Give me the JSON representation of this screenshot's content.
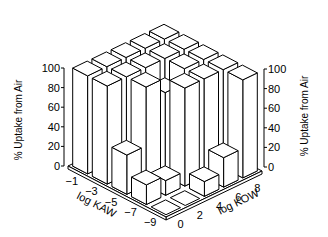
{
  "chart_data": {
    "type": "bar3d",
    "title": "",
    "zlabel": "% Uptake from Air",
    "xlabel": "log KAW",
    "ylabel": "log KOW",
    "kaw_ticks": [
      "-1",
      "-3",
      "-5",
      "-7",
      "-9"
    ],
    "kow_ticks": [
      "0",
      "2",
      "4",
      "6",
      "8"
    ],
    "z_ticks": [
      "0",
      "20",
      "40",
      "60",
      "80",
      "100"
    ],
    "zlim": [
      0,
      100
    ],
    "rows_kaw": [
      -1,
      -3,
      -5,
      -7,
      -9
    ],
    "cols_kow": [
      0,
      2,
      4,
      6,
      8
    ],
    "values": [
      [
        100,
        100,
        100,
        100,
        100
      ],
      [
        100,
        100,
        100,
        100,
        100
      ],
      [
        40,
        100,
        85,
        100,
        100
      ],
      [
        20,
        15,
        100,
        100,
        100
      ],
      [
        0,
        0,
        15,
        30,
        100
      ]
    ]
  },
  "colors": {
    "line": "#000000",
    "face": "#ffffff"
  }
}
